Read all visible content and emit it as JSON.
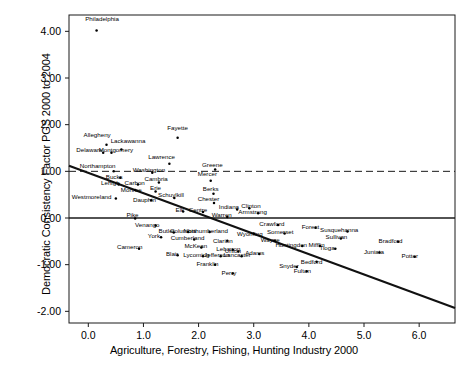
{
  "chart_data": {
    "type": "scatter",
    "title": "",
    "xlabel": "Agriculture, Forestry, Fishing, Hunting Industry 2000",
    "ylabel": "Democratic Consistency Factor PGS 2000 to 2004",
    "xlim": [
      -0.35,
      6.65
    ],
    "ylim": [
      -2.25,
      4.35
    ],
    "xticks": [
      "0.0",
      "1.0",
      "2.0",
      "3.0",
      "4.0",
      "5.0",
      "6.0"
    ],
    "xtick_values": [
      0.0,
      1.0,
      2.0,
      3.0,
      4.0,
      5.0,
      6.0
    ],
    "yticks": [
      "4.00",
      "3.00",
      "2.00",
      "1.00",
      "0.00",
      "-1.00",
      "-2.00"
    ],
    "ytick_values": [
      4.0,
      3.0,
      2.0,
      1.0,
      0.0,
      -1.0,
      -2.0
    ],
    "grid": false,
    "legend": "none",
    "reference_lines": [
      {
        "name": "zero-line",
        "orientation": "horizontal",
        "y": 0.0,
        "style": "solid"
      },
      {
        "name": "one-line",
        "orientation": "horizontal",
        "y": 1.0,
        "style": "dashed"
      }
    ],
    "fit_line": {
      "name": "regression-line",
      "style": "solid",
      "x0": -0.35,
      "y0": 1.12,
      "x1": 6.65,
      "y1": -1.93
    },
    "point_label": "county",
    "points": [
      {
        "label": "Philadelphia",
        "x": 0.15,
        "y": 4.02,
        "lx": 0.25,
        "ly": 4.22
      },
      {
        "label": "Allegheny",
        "x": 0.33,
        "y": 1.57,
        "lx": 0.16,
        "ly": 1.73
      },
      {
        "label": "Fayette",
        "x": 1.62,
        "y": 1.72,
        "lx": 1.62,
        "ly": 1.88
      },
      {
        "label": "Lackawanna",
        "x": 0.6,
        "y": 1.47,
        "lx": 0.72,
        "ly": 1.6
      },
      {
        "label": "Delaware",
        "x": 0.27,
        "y": 1.4,
        "lx": 0.02,
        "ly": 1.41
      },
      {
        "label": "Montgomery",
        "x": 0.42,
        "y": 1.4,
        "lx": 0.5,
        "ly": 1.41
      },
      {
        "label": "Lawrence",
        "x": 1.47,
        "y": 1.16,
        "lx": 1.33,
        "ly": 1.26
      },
      {
        "label": "Greene",
        "x": 2.3,
        "y": 1.04,
        "lx": 2.25,
        "ly": 1.1
      },
      {
        "label": "Northampton",
        "x": 0.46,
        "y": 1.0,
        "lx": 0.17,
        "ly": 1.08
      },
      {
        "label": "Washington",
        "x": 1.16,
        "y": 0.97,
        "lx": 1.1,
        "ly": 0.98
      },
      {
        "label": "Bucks",
        "x": 0.58,
        "y": 0.86,
        "lx": 0.47,
        "ly": 0.84
      },
      {
        "label": "Mercer",
        "x": 2.22,
        "y": 0.8,
        "lx": 2.16,
        "ly": 0.89
      },
      {
        "label": "Lehigh",
        "x": 0.55,
        "y": 0.72,
        "lx": 0.4,
        "ly": 0.7
      },
      {
        "label": "Cambria",
        "x": 1.28,
        "y": 0.76,
        "lx": 1.23,
        "ly": 0.79
      },
      {
        "label": "Carbon",
        "x": 0.9,
        "y": 0.72,
        "lx": 0.84,
        "ly": 0.7
      },
      {
        "label": "Monroe",
        "x": 0.85,
        "y": 0.6,
        "lx": 0.78,
        "ly": 0.56
      },
      {
        "label": "Erie",
        "x": 1.22,
        "y": 0.57,
        "lx": 1.22,
        "ly": 0.59
      },
      {
        "label": "Berks",
        "x": 2.27,
        "y": 0.52,
        "lx": 2.22,
        "ly": 0.58
      },
      {
        "label": "Westmoreland",
        "x": 0.5,
        "y": 0.42,
        "lx": 0.06,
        "ly": 0.4
      },
      {
        "label": "Dauphin",
        "x": 1.14,
        "y": 0.38,
        "lx": 1.02,
        "ly": 0.35
      },
      {
        "label": "Schuylkill",
        "x": 1.56,
        "y": 0.43,
        "lx": 1.5,
        "ly": 0.44
      },
      {
        "label": "Chester",
        "x": 2.28,
        "y": 0.32,
        "lx": 2.18,
        "ly": 0.36
      },
      {
        "label": "Indiana",
        "x": 2.7,
        "y": 0.18,
        "lx": 2.55,
        "ly": 0.19
      },
      {
        "label": "Clinton",
        "x": 2.92,
        "y": 0.21,
        "lx": 2.95,
        "ly": 0.22
      },
      {
        "label": "Armstrong",
        "x": 3.08,
        "y": 0.1,
        "lx": 2.98,
        "ly": 0.09
      },
      {
        "label": "Elk",
        "x": 1.72,
        "y": 0.14,
        "lx": 1.66,
        "ly": 0.13
      },
      {
        "label": "Centre",
        "x": 2.08,
        "y": 0.13,
        "lx": 1.99,
        "ly": 0.13
      },
      {
        "label": "Warren",
        "x": 2.52,
        "y": 0.02,
        "lx": 2.42,
        "ly": 0.02
      },
      {
        "label": "Pike",
        "x": 0.85,
        "y": -0.01,
        "lx": 0.8,
        "ly": 0.02
      },
      {
        "label": "Venango",
        "x": 1.22,
        "y": -0.16,
        "lx": 1.07,
        "ly": -0.2
      },
      {
        "label": "Crawford",
        "x": 3.44,
        "y": -0.15,
        "lx": 3.33,
        "ly": -0.18
      },
      {
        "label": "Forest",
        "x": 4.12,
        "y": -0.21,
        "lx": 4.03,
        "ly": -0.24
      },
      {
        "label": "Somerset",
        "x": 3.56,
        "y": -0.33,
        "lx": 3.48,
        "ly": -0.35
      },
      {
        "label": "Susquehanna",
        "x": 4.7,
        "y": -0.29,
        "lx": 4.55,
        "ly": -0.3
      },
      {
        "label": "Butler",
        "x": 1.55,
        "y": -0.31,
        "lx": 1.42,
        "ly": -0.33
      },
      {
        "label": "Columbia",
        "x": 1.81,
        "y": -0.3,
        "lx": 1.72,
        "ly": -0.32
      },
      {
        "label": "Northumberland",
        "x": 2.2,
        "y": -0.3,
        "lx": 2.13,
        "ly": -0.32
      },
      {
        "label": "York",
        "x": 1.32,
        "y": -0.41,
        "lx": 1.19,
        "ly": -0.42
      },
      {
        "label": "Wyoming",
        "x": 3.0,
        "y": -0.33,
        "lx": 2.93,
        "ly": -0.38
      },
      {
        "label": "Sullivan",
        "x": 4.58,
        "y": -0.44,
        "lx": 4.5,
        "ly": -0.46
      },
      {
        "label": "Cumberland",
        "x": 1.92,
        "y": -0.46,
        "lx": 1.8,
        "ly": -0.48
      },
      {
        "label": "Clarion",
        "x": 2.52,
        "y": -0.49,
        "lx": 2.44,
        "ly": -0.53
      },
      {
        "label": "Wayne",
        "x": 3.38,
        "y": -0.49,
        "lx": 3.3,
        "ly": -0.51
      },
      {
        "label": "Bradford",
        "x": 5.62,
        "y": -0.51,
        "lx": 5.48,
        "ly": -0.53
      },
      {
        "label": "Cameron",
        "x": 0.92,
        "y": -0.66,
        "lx": 0.75,
        "ly": -0.67
      },
      {
        "label": "McKean",
        "x": 2.05,
        "y": -0.63,
        "lx": 1.95,
        "ly": -0.65
      },
      {
        "label": "Huntingdon",
        "x": 3.88,
        "y": -0.6,
        "lx": 3.68,
        "ly": -0.62
      },
      {
        "label": "Mifflin",
        "x": 4.2,
        "y": -0.6,
        "lx": 4.14,
        "ly": -0.62
      },
      {
        "label": "Blair",
        "x": 1.62,
        "y": -0.8,
        "lx": 1.52,
        "ly": -0.82
      },
      {
        "label": "Lebanon",
        "x": 2.62,
        "y": -0.68,
        "lx": 2.54,
        "ly": -0.7
      },
      {
        "label": "Union",
        "x": 2.72,
        "y": -0.72,
        "lx": 2.62,
        "ly": -0.76
      },
      {
        "label": "Lycoming",
        "x": 2.08,
        "y": -0.82,
        "lx": 1.96,
        "ly": -0.84
      },
      {
        "label": "Jefferson",
        "x": 2.4,
        "y": -0.82,
        "lx": 2.33,
        "ly": -0.84
      },
      {
        "label": "Lancaster",
        "x": 2.78,
        "y": -0.82,
        "lx": 2.7,
        "ly": -0.84
      },
      {
        "label": "Adams",
        "x": 3.1,
        "y": -0.77,
        "lx": 3.02,
        "ly": -0.79
      },
      {
        "label": "Juniata",
        "x": 5.28,
        "y": -0.74,
        "lx": 5.18,
        "ly": -0.77
      },
      {
        "label": "Tioga",
        "x": 4.48,
        "y": -0.66,
        "lx": 4.33,
        "ly": -0.68
      },
      {
        "label": "Potter",
        "x": 5.92,
        "y": -0.83,
        "lx": 5.83,
        "ly": -0.86
      },
      {
        "label": "Franklin",
        "x": 2.3,
        "y": -1.0,
        "lx": 2.16,
        "ly": -1.03
      },
      {
        "label": "Bedford",
        "x": 4.14,
        "y": -0.94,
        "lx": 4.05,
        "ly": -0.98
      },
      {
        "label": "Snyder",
        "x": 3.78,
        "y": -1.05,
        "lx": 3.64,
        "ly": -1.08
      },
      {
        "label": "Perry",
        "x": 2.62,
        "y": -1.19,
        "lx": 2.55,
        "ly": -1.22
      },
      {
        "label": "Fulton",
        "x": 3.96,
        "y": -1.14,
        "lx": 3.88,
        "ly": -1.17
      }
    ]
  }
}
